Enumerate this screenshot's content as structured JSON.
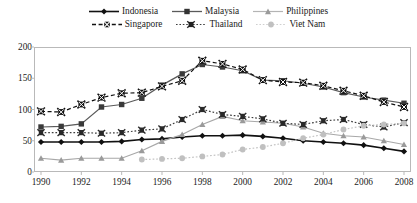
{
  "chart_data": {
    "type": "line",
    "title": "",
    "subtitle": "",
    "xlabel": "",
    "ylabel": "",
    "xlim": [
      1990,
      2008
    ],
    "ylim": [
      0,
      200
    ],
    "yticks": [
      "0",
      "50",
      "100",
      "150",
      "200"
    ],
    "ytick_values": [
      0,
      50,
      100,
      150,
      200
    ],
    "xticks": [
      "1990",
      "1992",
      "1994",
      "1996",
      "1998",
      "2000",
      "2002",
      "2004",
      "2006",
      "2008"
    ],
    "xtick_values": [
      1990,
      1992,
      1994,
      1996,
      1998,
      2000,
      2002,
      2004,
      2006,
      2008
    ],
    "x": [
      1990,
      1991,
      1992,
      1993,
      1994,
      1995,
      1996,
      1997,
      1998,
      1999,
      2000,
      2001,
      2002,
      2003,
      2004,
      2005,
      2006,
      2007,
      2008
    ],
    "grid": false,
    "legend_position": "top",
    "series": [
      {
        "name": "Indonesia",
        "color": "#111111",
        "marker": "diamond",
        "dash": "solid",
        "values": [
          48,
          48,
          48,
          48,
          49,
          52,
          53,
          56,
          58,
          58,
          59,
          57,
          54,
          50,
          48,
          46,
          43,
          38,
          33
        ]
      },
      {
        "name": "Malaysia",
        "color": "#5a5a5a",
        "marker": "square",
        "dash": "solid",
        "values": [
          72,
          73,
          77,
          104,
          108,
          118,
          139,
          157,
          172,
          168,
          162,
          147,
          146,
          142,
          136,
          127,
          120,
          115,
          110
        ]
      },
      {
        "name": "Philippines",
        "color": "#a8a8a8",
        "marker": "triangle",
        "dash": "solid",
        "values": [
          22,
          19,
          22,
          22,
          22,
          34,
          49,
          60,
          76,
          89,
          82,
          80,
          78,
          72,
          62,
          58,
          56,
          50,
          44
        ]
      },
      {
        "name": "Singapore",
        "color": "#111111",
        "marker": "x-box",
        "dash": "dashed",
        "values": [
          97,
          96,
          108,
          119,
          126,
          127,
          137,
          146,
          178,
          173,
          164,
          147,
          144,
          143,
          138,
          130,
          122,
          112,
          104
        ]
      },
      {
        "name": "Thailand",
        "color": "#3d3d3d",
        "marker": "x-star",
        "dash": "dotted",
        "values": [
          63,
          63,
          63,
          62,
          63,
          67,
          69,
          84,
          100,
          92,
          89,
          85,
          78,
          76,
          82,
          84,
          76,
          72,
          79
        ]
      },
      {
        "name": "Viet Nam",
        "color": "#c4c4c4",
        "marker": "circle",
        "dash": "dotted",
        "values": [
          null,
          null,
          null,
          null,
          null,
          20,
          21,
          22,
          25,
          28,
          36,
          40,
          46,
          54,
          60,
          68,
          74,
          76,
          78
        ]
      }
    ]
  },
  "legend": {
    "rows": [
      [
        {
          "label": "Indonesia",
          "key": "legend-key-indonesia"
        },
        {
          "label": "Malaysia",
          "key": "legend-key-malaysia"
        },
        {
          "label": "Philippines",
          "key": "legend-key-philippines"
        }
      ],
      [
        {
          "label": "Singapore",
          "key": "legend-key-singapore"
        },
        {
          "label": "Thailand",
          "key": "legend-key-thailand"
        },
        {
          "label": "Viet Nam",
          "key": "legend-key-vietnam"
        }
      ]
    ]
  },
  "colors": {
    "indonesia": "#111111",
    "malaysia": "#5a5a5a",
    "philippines": "#a8a8a8",
    "singapore": "#111111",
    "thailand": "#3d3d3d",
    "vietnam": "#c4c4c4",
    "frame": "#b9b9b9",
    "background": "#ffffff"
  }
}
